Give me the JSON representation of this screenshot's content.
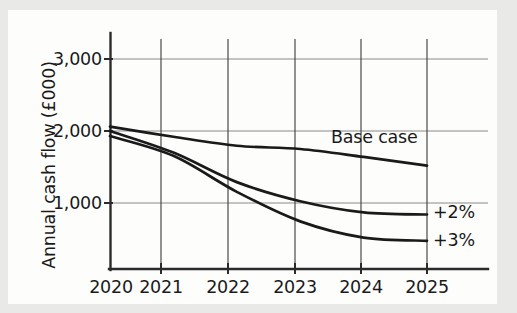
{
  "chart_data": {
    "type": "line",
    "title": "",
    "xlabel": "",
    "ylabel": "Annual cash flow (£000)",
    "categories": [
      "2020",
      "2021",
      "2022",
      "2023",
      "2024",
      "2025"
    ],
    "x": [
      2020,
      2021,
      2022,
      2023,
      2024,
      2025
    ],
    "xlim": [
      2020,
      2025
    ],
    "ylim": [
      0,
      3300
    ],
    "yticks": [
      "1,000",
      "2,000",
      "3,000"
    ],
    "ytick_values": [
      1000,
      2000,
      3000
    ],
    "grid": "both",
    "legend_position": "inline-right",
    "series": [
      {
        "name": "Base case",
        "label": "Base case",
        "values": [
          2060,
          1920,
          1795,
          1750,
          1640,
          1520
        ],
        "color": "#1a1a1a"
      },
      {
        "name": "+2%",
        "label": "+2%",
        "values": [
          2000,
          1700,
          1290,
          1025,
          870,
          840
        ],
        "color": "#1a1a1a"
      },
      {
        "name": "+3%",
        "label": "+3%",
        "values": [
          1930,
          1655,
          1155,
          745,
          520,
          475
        ],
        "color": "#1a1a1a"
      }
    ],
    "annotations": [
      {
        "text": "Base case",
        "x": 2023.6,
        "y": 1870
      },
      {
        "text": "+2%",
        "x": 2025.15,
        "y": 860
      },
      {
        "text": "+3%",
        "x": 2025.15,
        "y": 520
      }
    ]
  },
  "style": {
    "background": "#e9e9e7",
    "panel": "#fdfdfc",
    "axis_color": "#2b2b2b",
    "grid_color": "#8a8a8a",
    "line_color": "#1a1a1a",
    "text_color": "#1a1a1a"
  }
}
